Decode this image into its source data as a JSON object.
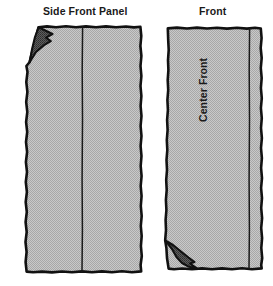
{
  "diagram": {
    "kind": "sewing-pattern-illustration",
    "background_color": "#ffffff",
    "ink_color": "#111111",
    "fabric_fill_color": "#b9b9b9",
    "fold_corner_color": "#595959",
    "labels": {
      "side_front_panel": "Side Front Panel",
      "front": "Front",
      "center_front": "Center Front"
    },
    "panels": [
      {
        "name": "side-front-panel",
        "title": "Side Front Panel",
        "seam_lines": 1,
        "folded_corner": "top-left"
      },
      {
        "name": "front-panel",
        "title": "Front",
        "inner_label": "Center Front",
        "seam_lines": 1,
        "folded_corner": "bottom-left"
      }
    ]
  }
}
